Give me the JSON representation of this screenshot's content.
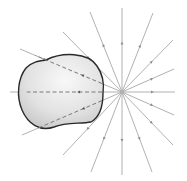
{
  "diagram": {
    "type": "electric-field-point-charge-with-closed-surface",
    "width": 187,
    "height": 181,
    "colors": {
      "background": "#ffffff",
      "field_line": "#a8a8a8",
      "arrow": "#8c8c8c",
      "surface_stroke": "#2a2a2a",
      "surface_fill_light": "#f7f7f7",
      "surface_fill_dark": "#c9c9c9",
      "dashed_line": "#7a7a7a",
      "charge": "#b0b0b0"
    },
    "charge": {
      "x": 122,
      "y": 92,
      "direction": "outward"
    },
    "field_lines": [
      {
        "x2": 122,
        "y2": 8
      },
      {
        "x2": 153,
        "y2": 13
      },
      {
        "x2": 173,
        "y2": 40
      },
      {
        "x2": 174,
        "y2": 69
      },
      {
        "x2": 175,
        "y2": 92
      },
      {
        "x2": 174,
        "y2": 115
      },
      {
        "x2": 173,
        "y2": 145
      },
      {
        "x2": 152,
        "y2": 172
      },
      {
        "x2": 122,
        "y2": 175
      },
      {
        "x2": 91,
        "y2": 172
      },
      {
        "x2": 63,
        "y2": 155
      },
      {
        "x2": 22,
        "y2": 135
      },
      {
        "x2": 10,
        "y2": 92
      },
      {
        "x2": 20,
        "y2": 49
      },
      {
        "x2": 63,
        "y2": 32
      },
      {
        "x2": 90,
        "y2": 12
      }
    ],
    "surface_path": "M 46 60 C 62 52, 88 52, 97 66 C 104 76, 104 86, 103 93 C 103 106, 100 117, 91 122 C 80 124, 66 122, 54 127 C 40 132, 28 124, 22 110 C 16 96, 18 78, 26 68 C 32 62, 38 61, 46 60 Z"
  }
}
